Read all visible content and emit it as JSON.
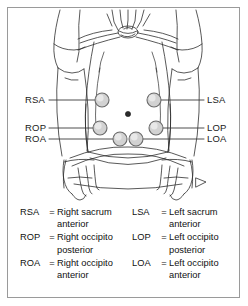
{
  "diagram": {
    "navel_label": "navel",
    "markers": [
      {
        "code": "RSA",
        "side": "right",
        "row": "upper"
      },
      {
        "code": "ROP",
        "side": "right",
        "row": "middle"
      },
      {
        "code": "ROA",
        "side": "right",
        "row": "lower"
      },
      {
        "code": "LSA",
        "side": "left",
        "row": "upper"
      },
      {
        "code": "LOP",
        "side": "left",
        "row": "middle"
      },
      {
        "code": "LOA",
        "side": "left",
        "row": "lower"
      }
    ],
    "callouts": {
      "left": [
        "RSA",
        "ROP",
        "ROA"
      ],
      "right": [
        "LSA",
        "LOP",
        "LOA"
      ]
    }
  },
  "legend": {
    "equals": "=",
    "left": [
      {
        "abbr": "RSA",
        "term1": "Right sacrum",
        "term2": "anterior"
      },
      {
        "abbr": "ROP",
        "term1": "Right occipito",
        "term2": "posterior"
      },
      {
        "abbr": "ROA",
        "term1": "Right occipito",
        "term2": "anterior"
      }
    ],
    "right": [
      {
        "abbr": "LSA",
        "term1": "Left sacrum",
        "term2": "anterior"
      },
      {
        "abbr": "LOP",
        "term1": "Left occipito",
        "term2": "posterior"
      },
      {
        "abbr": "LOA",
        "term1": "Left occipito",
        "term2": "anterior"
      }
    ]
  },
  "colors": {
    "border": "#9a9a9a",
    "ink": "#1a1a1a",
    "marker_fill": "#d2d2d2",
    "marker_stroke": "#6b6b6b",
    "leader": "#3a3a3a",
    "navel": "#2b2b2b"
  }
}
